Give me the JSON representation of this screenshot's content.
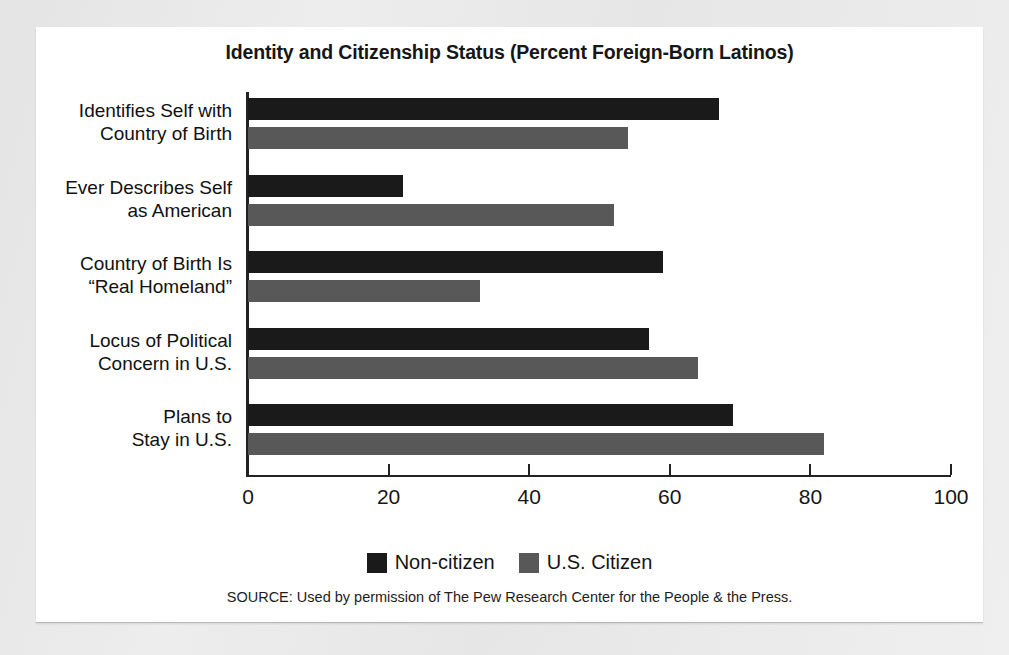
{
  "chart_data": {
    "type": "bar",
    "orientation": "horizontal",
    "title": "Identity and Citizenship Status (Percent Foreign-Born Latinos)",
    "xlabel": "",
    "ylabel": "",
    "xlim": [
      0,
      100
    ],
    "xticks": [
      0,
      20,
      40,
      60,
      80,
      100
    ],
    "xtick_labels": [
      "0",
      "20",
      "40",
      "60",
      "80",
      "100"
    ],
    "grid": false,
    "legend_position": "bottom-center",
    "categories": [
      "Identifies Self with\nCountry of Birth",
      "Ever Describes Self\nas American",
      "Country of Birth Is\n“Real Homeland”",
      "Locus of Political\nConcern in U.S.",
      "Plans to\nStay in U.S."
    ],
    "series": [
      {
        "name": "Non-citizen",
        "color": "#1a1a1a",
        "values": [
          67,
          22,
          59,
          57,
          69
        ]
      },
      {
        "name": "U.S. Citizen",
        "color": "#585858",
        "values": [
          54,
          52,
          33,
          64,
          82
        ]
      }
    ],
    "source": "SOURCE: Used by permission of The Pew Research Center for the People & the Press."
  }
}
